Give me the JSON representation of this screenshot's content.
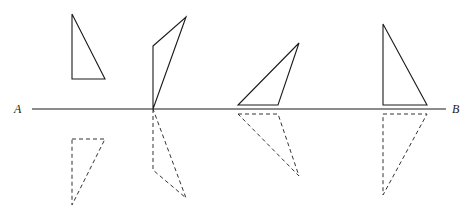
{
  "diagram": {
    "type": "reflection-in-line",
    "line": {
      "start_label": "A",
      "end_label": "B",
      "x1": 32,
      "x2": 446,
      "y": 109
    },
    "triangles": [
      {
        "name": "triangle-1",
        "original": [
          [
            72,
            14
          ],
          [
            72,
            79
          ],
          [
            105,
            79
          ]
        ],
        "reflection": [
          [
            72,
            139
          ],
          [
            105,
            139
          ],
          [
            72,
            205
          ]
        ]
      },
      {
        "name": "triangle-2",
        "original": [
          [
            153,
            46
          ],
          [
            186,
            17
          ],
          [
            153,
            109
          ]
        ],
        "reflection": [
          [
            153,
            109
          ],
          [
            153,
            170
          ],
          [
            186,
            198
          ]
        ]
      },
      {
        "name": "triangle-3",
        "original": [
          [
            238,
            105
          ],
          [
            278,
            105
          ],
          [
            299,
            43
          ]
        ],
        "reflection": [
          [
            238,
            114
          ],
          [
            278,
            114
          ],
          [
            299,
            176
          ]
        ]
      },
      {
        "name": "triangle-4",
        "original": [
          [
            383,
            24
          ],
          [
            383,
            105
          ],
          [
            427,
            105
          ]
        ],
        "reflection": [
          [
            383,
            114
          ],
          [
            427,
            114
          ],
          [
            383,
            195
          ]
        ]
      }
    ],
    "colors": {
      "ink": "#1a1a1a",
      "background": "#ffffff"
    }
  }
}
